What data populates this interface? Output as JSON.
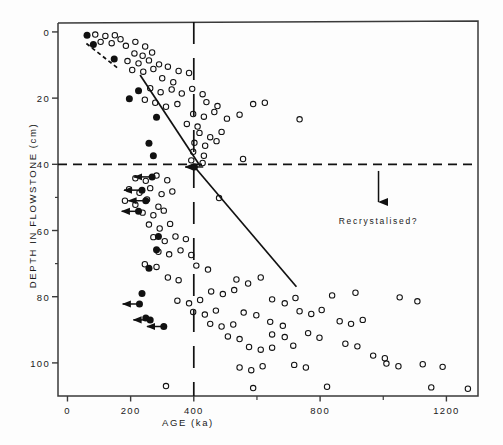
{
  "figure": {
    "background": "#fdfdfd",
    "frame_color": "#3a3a3a",
    "marker_color": "#111111"
  },
  "chart_data": {
    "type": "scatter",
    "title": "",
    "xlabel": "AGE (ka)",
    "ylabel": "DEPTH IN FLOWSTONE (cm)",
    "xlim": [
      -30,
      1300
    ],
    "ylim": [
      110,
      -3
    ],
    "y_inverted": true,
    "grid": false,
    "legend": null,
    "xticks_major": [
      0,
      200,
      400,
      800,
      1200
    ],
    "xticks_minor": [
      600,
      1000
    ],
    "xtick_labels": [
      "0",
      "200",
      "400",
      "800",
      "1200"
    ],
    "yticks_major": [
      0,
      20,
      40,
      60,
      80,
      100
    ],
    "ytick_labels": [
      "0",
      "20",
      "40",
      "60",
      "80",
      "100"
    ],
    "yticks_minor": [
      50,
      70
    ],
    "annotations": [
      {
        "name": "recrystalised-annotation",
        "text": "Recrystalised?",
        "arrow_x": 985,
        "arrow_y_from": 42,
        "arrow_y_to": 52,
        "label_x": 985,
        "label_y": 57
      }
    ],
    "reference_lines": [
      {
        "name": "depth-40-dashed",
        "orientation": "horizontal",
        "value": 40,
        "style": "dashed"
      },
      {
        "name": "age-400-dashed",
        "orientation": "vertical",
        "value": 400,
        "style": "dashed"
      }
    ],
    "trend_lines": [
      {
        "name": "upper-trend-line",
        "style": "solid",
        "points": [
          [
            230,
            13.0
          ],
          [
            420,
            40.5
          ]
        ]
      },
      {
        "name": "lower-trend-line",
        "style": "solid",
        "points": [
          [
            400,
            40.5
          ],
          [
            725,
            77.0
          ]
        ]
      },
      {
        "name": "top-dashed-trend",
        "style": "dashed",
        "points": [
          [
            60,
            3.5
          ],
          [
            160,
            11.0
          ]
        ]
      }
    ],
    "series": [
      {
        "name": "open-circles",
        "marker": "open-circle",
        "label": "",
        "points": [
          [
            88,
            0.8
          ],
          [
            120,
            1.2
          ],
          [
            150,
            1.0
          ],
          [
            105,
            3.0
          ],
          [
            140,
            3.4
          ],
          [
            168,
            2.2
          ],
          [
            185,
            4.2
          ],
          [
            215,
            3.0
          ],
          [
            246,
            4.4
          ],
          [
            212,
            6.5
          ],
          [
            238,
            7.2
          ],
          [
            268,
            6.2
          ],
          [
            190,
            8.8
          ],
          [
            225,
            9.5
          ],
          [
            258,
            8.6
          ],
          [
            290,
            9.8
          ],
          [
            205,
            11.5
          ],
          [
            240,
            12.0
          ],
          [
            272,
            11.2
          ],
          [
            318,
            10.5
          ],
          [
            352,
            11.8
          ],
          [
            385,
            12.4
          ],
          [
            300,
            14.0
          ],
          [
            335,
            15.2
          ],
          [
            262,
            17.0
          ],
          [
            295,
            18.2
          ],
          [
            330,
            17.4
          ],
          [
            362,
            18.6
          ],
          [
            395,
            17.2
          ],
          [
            428,
            18.8
          ],
          [
            245,
            20.5
          ],
          [
            278,
            21.4
          ],
          [
            312,
            22.6
          ],
          [
            348,
            21.8
          ],
          [
            440,
            21.2
          ],
          [
            475,
            22.4
          ],
          [
            588,
            21.8
          ],
          [
            625,
            21.4
          ],
          [
            398,
            24.8
          ],
          [
            432,
            25.6
          ],
          [
            465,
            24.2
          ],
          [
            505,
            26.2
          ],
          [
            545,
            25.0
          ],
          [
            378,
            27.8
          ],
          [
            412,
            28.6
          ],
          [
            735,
            26.4
          ],
          [
            418,
            30.5
          ],
          [
            452,
            31.8
          ],
          [
            488,
            30.2
          ],
          [
            402,
            33.5
          ],
          [
            436,
            34.4
          ],
          [
            472,
            33.0
          ],
          [
            398,
            36.2
          ],
          [
            432,
            37.4
          ],
          [
            392,
            38.8
          ],
          [
            428,
            39.6
          ],
          [
            556,
            38.4
          ],
          [
            215,
            44.2
          ],
          [
            248,
            45.0
          ],
          [
            282,
            43.4
          ],
          [
            316,
            44.8
          ],
          [
            195,
            47.5
          ],
          [
            228,
            48.6
          ],
          [
            262,
            47.2
          ],
          [
            298,
            49.0
          ],
          [
            332,
            48.2
          ],
          [
            182,
            51.0
          ],
          [
            215,
            52.2
          ],
          [
            252,
            50.6
          ],
          [
            288,
            52.8
          ],
          [
            480,
            50.2
          ],
          [
            238,
            54.6
          ],
          [
            272,
            55.4
          ],
          [
            305,
            54.0
          ],
          [
            258,
            58.2
          ],
          [
            292,
            59.4
          ],
          [
            325,
            58.0
          ],
          [
            272,
            62.0
          ],
          [
            308,
            63.2
          ],
          [
            342,
            61.8
          ],
          [
            375,
            62.6
          ],
          [
            288,
            66.4
          ],
          [
            322,
            67.2
          ],
          [
            358,
            66.0
          ],
          [
            392,
            67.4
          ],
          [
            245,
            70.2
          ],
          [
            282,
            71.0
          ],
          [
            408,
            70.6
          ],
          [
            445,
            71.8
          ],
          [
            318,
            74.2
          ],
          [
            352,
            75.0
          ],
          [
            535,
            74.8
          ],
          [
            572,
            76.0
          ],
          [
            612,
            74.2
          ],
          [
            455,
            78.4
          ],
          [
            492,
            79.2
          ],
          [
            528,
            78.0
          ],
          [
            348,
            81.2
          ],
          [
            385,
            82.0
          ],
          [
            420,
            81.0
          ],
          [
            648,
            80.8
          ],
          [
            688,
            82.0
          ],
          [
            722,
            80.4
          ],
          [
            838,
            79.6
          ],
          [
            912,
            78.8
          ],
          [
            1052,
            80.2
          ],
          [
            1108,
            81.4
          ],
          [
            398,
            84.6
          ],
          [
            435,
            85.4
          ],
          [
            470,
            84.2
          ],
          [
            558,
            84.8
          ],
          [
            598,
            85.6
          ],
          [
            735,
            84.4
          ],
          [
            772,
            85.2
          ],
          [
            805,
            84.0
          ],
          [
            452,
            88.2
          ],
          [
            488,
            89.0
          ],
          [
            525,
            88.4
          ],
          [
            642,
            87.6
          ],
          [
            682,
            88.8
          ],
          [
            862,
            87.4
          ],
          [
            898,
            88.2
          ],
          [
            935,
            87.0
          ],
          [
            508,
            92.0
          ],
          [
            545,
            92.8
          ],
          [
            648,
            91.4
          ],
          [
            688,
            92.2
          ],
          [
            762,
            91.0
          ],
          [
            798,
            92.4
          ],
          [
            575,
            95.2
          ],
          [
            612,
            96.0
          ],
          [
            648,
            95.4
          ],
          [
            715,
            94.8
          ],
          [
            880,
            94.2
          ],
          [
            918,
            95.0
          ],
          [
            968,
            97.8
          ],
          [
            1005,
            98.6
          ],
          [
            545,
            101.4
          ],
          [
            582,
            102.2
          ],
          [
            618,
            101.0
          ],
          [
            718,
            100.6
          ],
          [
            755,
            101.4
          ],
          [
            1010,
            100.2
          ],
          [
            1048,
            101.0
          ],
          [
            1125,
            100.4
          ],
          [
            1188,
            101.2
          ],
          [
            312,
            107.0
          ],
          [
            588,
            107.6
          ],
          [
            822,
            107.2
          ],
          [
            1152,
            107.4
          ],
          [
            1268,
            107.8
          ]
        ]
      },
      {
        "name": "filled-circles",
        "marker": "filled-circle",
        "label": "",
        "points": [
          [
            62,
            1.0
          ],
          [
            82,
            3.8
          ],
          [
            148,
            8.2
          ],
          [
            225,
            17.8
          ],
          [
            196,
            20.2
          ],
          [
            282,
            25.8
          ],
          [
            258,
            33.6
          ],
          [
            272,
            37.4
          ],
          [
            402,
            40.8
          ],
          [
            268,
            43.8
          ],
          [
            236,
            47.8
          ],
          [
            248,
            51.0
          ],
          [
            225,
            54.2
          ],
          [
            288,
            61.8
          ],
          [
            282,
            65.8
          ],
          [
            258,
            71.4
          ],
          [
            236,
            79.0
          ],
          [
            228,
            82.2
          ],
          [
            248,
            86.4
          ],
          [
            262,
            87.0
          ],
          [
            305,
            89.0
          ]
        ]
      }
    ],
    "arrow_markers": [
      {
        "name": "left-arrow-1",
        "x": 268,
        "y": 43.8,
        "length": 62,
        "direction": "left"
      },
      {
        "name": "left-arrow-2",
        "x": 236,
        "y": 47.8,
        "length": 62,
        "direction": "left"
      },
      {
        "name": "left-arrow-3",
        "x": 248,
        "y": 51.0,
        "length": 60,
        "direction": "left"
      },
      {
        "name": "left-arrow-4",
        "x": 225,
        "y": 54.2,
        "length": 58,
        "direction": "left"
      },
      {
        "name": "left-arrow-5",
        "x": 228,
        "y": 82.2,
        "length": 58,
        "direction": "left"
      },
      {
        "name": "left-arrow-6",
        "x": 262,
        "y": 87.0,
        "length": 58,
        "direction": "left"
      },
      {
        "name": "left-arrow-7",
        "x": 305,
        "y": 89.0,
        "length": 58,
        "direction": "left"
      },
      {
        "name": "left-arrow-8",
        "x": 430,
        "y": 40.8,
        "length": 62,
        "direction": "left"
      }
    ]
  }
}
